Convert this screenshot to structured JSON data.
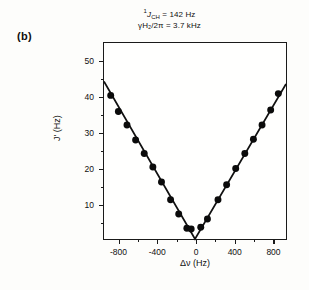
{
  "panel": {
    "label": "(b)"
  },
  "annotations": {
    "line1_pre": "1",
    "line1_sym": "J",
    "line1_sub": "CH",
    "line1_post": " = 142 Hz",
    "line2": "γH₂/2π = 3.7 kHz"
  },
  "chart_data": {
    "type": "line",
    "title": "",
    "xlabel": "Δν (Hz)",
    "ylabel": "J' (Hz)",
    "xlim": [
      -950,
      950
    ],
    "ylim": [
      0,
      55
    ],
    "grid": false,
    "legend": null,
    "xticks": [
      -800,
      -400,
      0,
      400,
      800
    ],
    "xticklabels": [
      "-800",
      "-400",
      "0",
      "400",
      "800"
    ],
    "xminor": [
      -600,
      -200,
      200,
      600
    ],
    "yticks": [
      10,
      20,
      30,
      40,
      50
    ],
    "yticklabels": [
      "10",
      "20",
      "30",
      "40",
      "50"
    ],
    "yminor": [
      5,
      15,
      25,
      35,
      45
    ],
    "marker": "filled-circle",
    "series": [
      {
        "name": "J' vs Δν",
        "x": [
          -880,
          -800,
          -710,
          -620,
          -530,
          -440,
          -350,
          -255,
          -170,
          -85,
          -40,
          60,
          130,
          240,
          330,
          425,
          520,
          610,
          700,
          790,
          870
        ],
        "y": [
          40.3,
          35.8,
          32.0,
          27.8,
          24.0,
          20.2,
          16.0,
          11.0,
          7.0,
          3.0,
          2.8,
          3.3,
          5.6,
          11.0,
          15.2,
          19.8,
          24.0,
          28.0,
          32.0,
          36.2,
          40.8
        ]
      }
    ],
    "fit_line": {
      "name": "V-shaped fit",
      "x": [
        -950,
        0,
        950
      ],
      "y": [
        44.2,
        0.0,
        43.5
      ]
    }
  }
}
